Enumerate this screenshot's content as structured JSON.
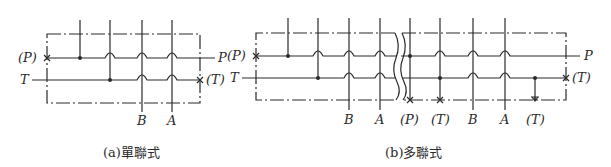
{
  "diagram_a": {
    "caption": "(a)單聯式",
    "labels": {
      "p_left": "(P)",
      "p_right": "P",
      "t_left": "T",
      "t_right": "(T)",
      "bottom": [
        "B",
        "A"
      ]
    }
  },
  "diagram_b": {
    "caption": "(b)多聯式",
    "labels": {
      "p_left": "(P)",
      "p_right": "P",
      "t_left": "T",
      "t_right": "(T)",
      "bottom": [
        "B",
        "A",
        "(P)",
        "(T)",
        "B",
        "A",
        "(T)"
      ]
    }
  },
  "colors": {
    "line": "#2a2a2a",
    "background": "#ffffff"
  }
}
